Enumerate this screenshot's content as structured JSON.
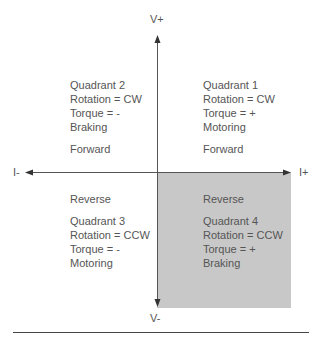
{
  "diagram": {
    "axes": {
      "v_plus": "V+",
      "v_minus": "V-",
      "i_minus": "I-",
      "i_plus": "I+"
    },
    "quadrants": [
      {
        "id": 1,
        "direction": "Forward",
        "lines": [
          "Quadrant 1",
          "Rotation = CW",
          "Torque = +",
          "Motoring"
        ],
        "shaded": false
      },
      {
        "id": 2,
        "direction": "Forward",
        "lines": [
          "Quadrant 2",
          "Rotation = CW",
          "Torque = -",
          "Braking"
        ],
        "shaded": false
      },
      {
        "id": 3,
        "direction": "Reverse",
        "lines": [
          "Quadrant 3",
          "Rotation = CCW",
          "Torque = -",
          "Motoring"
        ],
        "shaded": false
      },
      {
        "id": 4,
        "direction": "Reverse",
        "lines": [
          "Quadrant 4",
          "Rotation = CCW",
          "Torque = +",
          "Braking"
        ],
        "shaded": true
      }
    ],
    "colors": {
      "axis": "#555555",
      "shade": "#c8c8c8",
      "text": "#555555",
      "rule": "#444444"
    }
  }
}
